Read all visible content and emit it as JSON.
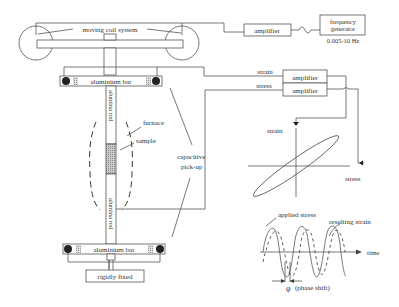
{
  "labels": {
    "moving_coil": "moving coil system",
    "amplifier_drive": "amplifier",
    "freq_gen_line1": "frequency",
    "freq_gen_line2": "generator",
    "freq_range": "0.005-10 Hz",
    "strain_signal": "strain",
    "stress_signal": "stress",
    "amplifier_strain": "amplifier",
    "amplifier_stress": "amplifier",
    "aluminium_bar_top": "aluminium bar",
    "aluminium_bar_bottom": "aluminium bar",
    "alumina_rod_top": "alumina rod",
    "alumina_rod_bottom": "alumina rod",
    "furnace": "furnace",
    "sample": "sample",
    "capacitive_line1": "capacitive",
    "capacitive_line2": "pick-up",
    "rigidly_fixed": "rigidly fixed",
    "plot_y": "strain",
    "plot_x": "stress",
    "applied_stress": "applied stress",
    "resulting_strain": "resulting strain",
    "time": "time",
    "phi": "φ",
    "phase_shift": "(phase shift)"
  },
  "colors": {
    "line": "#555555",
    "text": "#333333",
    "sample_fill": "#bbbbbb",
    "pivot": "#222222"
  }
}
